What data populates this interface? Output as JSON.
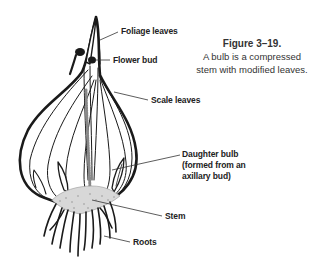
{
  "figure": {
    "number": "Figure 3–19.",
    "caption_line1": "A bulb is a compressed",
    "caption_line2": "stem with modified leaves."
  },
  "labels": {
    "foliage_leaves": "Foliage leaves",
    "flower_bud": "Flower bud",
    "scale_leaves": "Scale leaves",
    "daughter_bulb_line1": "Daughter bulb",
    "daughter_bulb_line2": "(formed from an",
    "daughter_bulb_line3": "axillary bud)",
    "stem": "Stem",
    "roots": "Roots"
  },
  "colors": {
    "ink": "#1a1a1a",
    "leader": "#333333",
    "stem_fill": "#d8d8d8",
    "background": "#ffffff"
  }
}
